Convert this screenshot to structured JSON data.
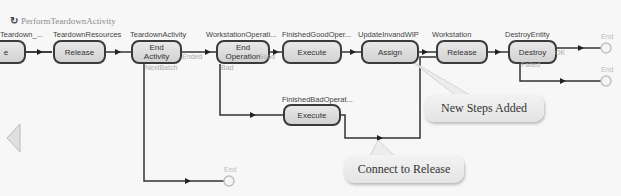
{
  "process": {
    "title": "PerformTeardownActivity",
    "icon": "process-icon"
  },
  "steps": [
    {
      "label": "Teardown_...",
      "action": "e"
    },
    {
      "label": "TeardownResources",
      "action": "Release"
    },
    {
      "label": "TeardownActivity",
      "action": "End Activity",
      "exits": [
        "Ended",
        "NextBatch"
      ]
    },
    {
      "label": "WorkstationOperati...",
      "action": "End Operation",
      "exits": [
        "Good",
        "Bad"
      ]
    },
    {
      "label": "FinishedGoodOper...",
      "action": "Execute"
    },
    {
      "label": "UpdateInvandWIP",
      "action": "Assign"
    },
    {
      "label": "Workstation",
      "action": "Release"
    },
    {
      "label": "DestroyEntity",
      "action": "Destroy",
      "exits": [
        "OK",
        "Failed"
      ]
    },
    {
      "label": "FinishedBadOperat...",
      "action": "Execute"
    }
  ],
  "end_nodes": [
    "End",
    "End",
    "End"
  ],
  "callouts": [
    {
      "text": "New Steps Added"
    },
    {
      "text": "Connect to Release"
    }
  ],
  "colors": {
    "connector": "#333333",
    "step_fill": "#dddddd",
    "step_border": "#3a3a3a",
    "end_node": "#c0c0c0"
  }
}
